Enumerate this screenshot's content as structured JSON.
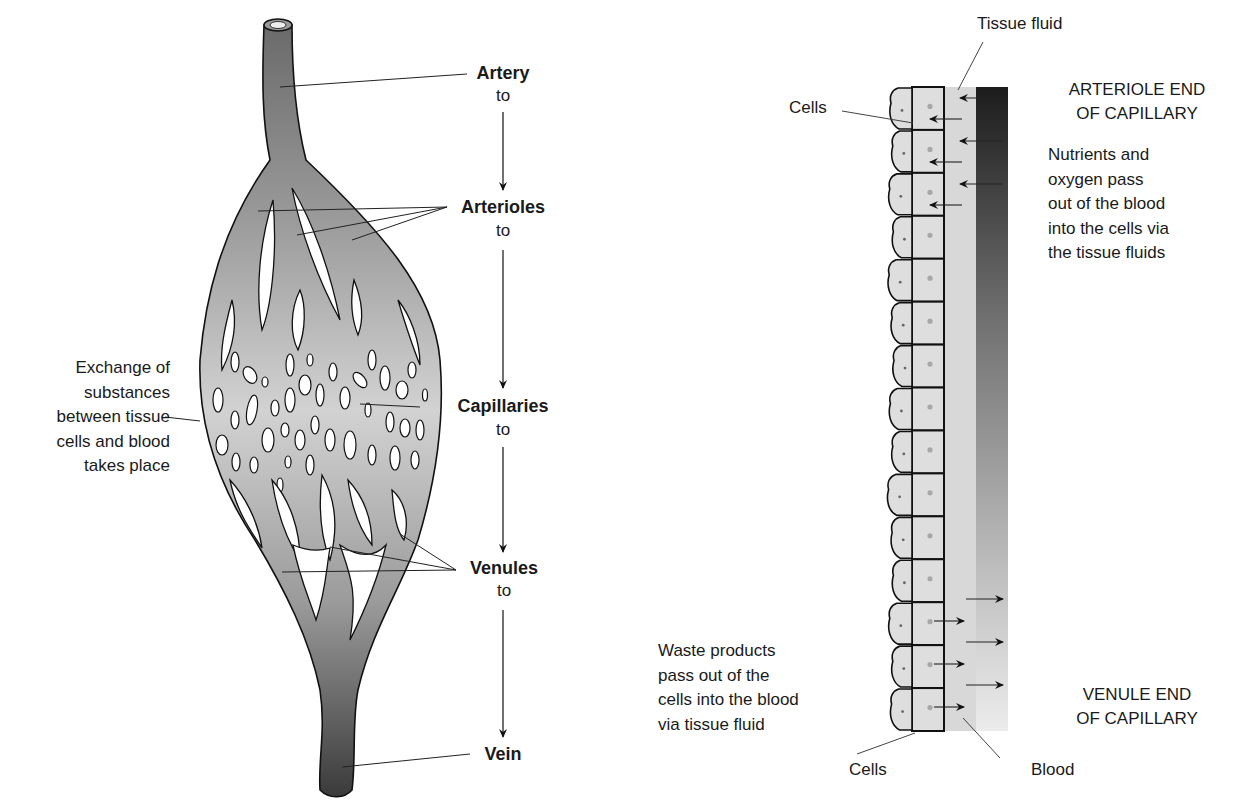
{
  "left_diagram": {
    "title": "Blood vessel pathway",
    "flow": [
      {
        "label": "Artery",
        "connector": "to"
      },
      {
        "label": "Arterioles",
        "connector": "to"
      },
      {
        "label": "Capillaries",
        "connector": "to"
      },
      {
        "label": "Venules",
        "connector": "to"
      },
      {
        "label": "Vein",
        "connector": ""
      }
    ],
    "side_note": "Exchange of\nsubstances\nbetween tissue\ncells and blood\ntakes place"
  },
  "right_diagram": {
    "title": "Capillary exchange",
    "labels": {
      "tissue_fluid": "Tissue fluid",
      "cells_top": "Cells",
      "cells_bottom": "Cells",
      "blood": "Blood",
      "arteriole_end": "ARTERIOLE END\nOF CAPILLARY",
      "venule_end": "VENULE END\nOF CAPILLARY",
      "nutrients_note": "Nutrients and\noxygen pass\nout of the blood\ninto the cells via\nthe tissue fluids",
      "waste_note": "Waste products\npass out of the\ncells into the blood\nvia tissue fluid"
    },
    "cell_count": 15
  },
  "colors": {
    "vessel_light": "#c8c8c8",
    "vessel_dark": "#4a4a4a",
    "cell_fill": "#dcdcdc",
    "tissue_fluid": "#d6d6d6",
    "blood_top": "#1e1e1e",
    "blood_bottom": "#e6e6e6",
    "outline": "#1a1a1a"
  }
}
